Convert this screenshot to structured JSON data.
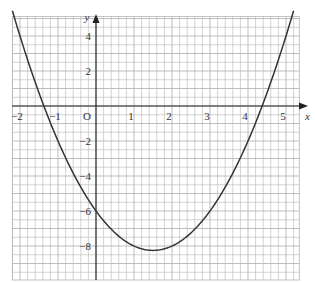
{
  "chart_data": {
    "type": "line",
    "title": "",
    "xlabel": "x",
    "ylabel": "y",
    "origin_label": "O",
    "xlim": [
      -2.2,
      5.35
    ],
    "ylim": [
      -10,
      5
    ],
    "grid": true,
    "grid_minor_x": 0.2,
    "grid_minor_y": 0.5,
    "x_ticks": [
      -2,
      -1,
      1,
      2,
      3,
      4,
      5
    ],
    "x_tick_labels": [
      "−2",
      "−1",
      "1",
      "2",
      "3",
      "4",
      "5"
    ],
    "y_ticks": [
      4,
      2,
      -2,
      -4,
      -6,
      -8
    ],
    "y_tick_labels": [
      "4",
      "2",
      "−2",
      "−4",
      "−6",
      "−8"
    ],
    "series": [
      {
        "name": "y = x² − 3x − 6",
        "equation": "x^2 - 3x - 6",
        "color": "#333333",
        "x": [
          -2.2,
          -2,
          -1.5,
          -1.37,
          -1,
          -0.5,
          0,
          0.5,
          1,
          1.5,
          2,
          2.5,
          3,
          3.5,
          4,
          4.37,
          4.5,
          5,
          5.2
        ],
        "y": [
          5.44,
          4,
          0.75,
          0,
          -2,
          -4.25,
          -6,
          -7.25,
          -8,
          -8.25,
          -8,
          -7.25,
          -6,
          -4.25,
          -2,
          0,
          0.75,
          4,
          4.64
        ]
      }
    ],
    "annotations": {
      "roots": [
        -1.37,
        4.37
      ],
      "vertex": [
        1.5,
        -8.25
      ],
      "y_intercept": -6
    }
  },
  "colors": {
    "grid": "#b5b5b5",
    "axis": "#222222",
    "curve": "#333333",
    "background": "#ffffff"
  }
}
